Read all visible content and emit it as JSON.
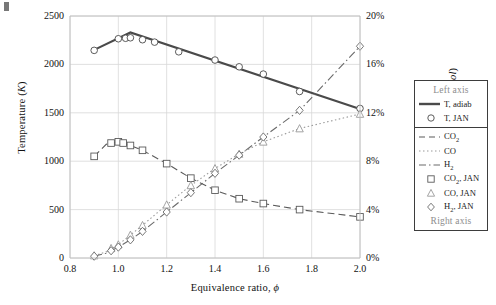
{
  "axes": {
    "left_title": "Temperature (K)",
    "left_title_unit": "K",
    "right_title": "Mole fraction (%mol)",
    "right_title_unit": "%mol",
    "x_title": "Equivalence ratio, ",
    "x_symbol": "ϕ",
    "left_ticks": [
      "0",
      "500",
      "1000",
      "1500",
      "2000",
      "2500"
    ],
    "right_ticks": [
      "0%",
      "4%",
      "8%",
      "12%",
      "16%",
      "20%"
    ],
    "x_ticks": [
      "0.8",
      "1.0",
      "1.2",
      "1.4",
      "1.6",
      "1.8",
      "2.0"
    ]
  },
  "legend": {
    "header": "Left axis",
    "footer": "Right axis",
    "items": [
      {
        "label": "T, adiab",
        "key": "solid-line",
        "color": "#4a4a4a"
      },
      {
        "label": "T, JAN",
        "key": "circle-marker",
        "color": "#4a4a4a"
      },
      {
        "label": "CO2",
        "key": "dashed-line",
        "color": "#5a5a5a"
      },
      {
        "label": "CO",
        "key": "dotted-line",
        "color": "#9a9a9a"
      },
      {
        "label": "H2",
        "key": "dashdot-line",
        "color": "#6a6a6a"
      },
      {
        "label": "CO2, JAN",
        "key": "square-marker",
        "color": "#5a5a5a"
      },
      {
        "label": "CO, JAN",
        "key": "triangle-marker",
        "color": "#9a9a9a"
      },
      {
        "label": "H2, JAN",
        "key": "diamond-marker",
        "color": "#6a6a6a"
      }
    ]
  },
  "chart_data": {
    "type": "line",
    "title": "",
    "xlabel": "Equivalence ratio, ϕ",
    "ylabel": "Temperature (K)",
    "y2label": "Mole fraction (%mol)",
    "xlim": [
      0.8,
      2.0
    ],
    "ylim": [
      0,
      2500
    ],
    "y2lim": [
      0,
      20
    ],
    "grid": true,
    "legend_position": "right-outside",
    "series": [
      {
        "name": "T, adiab",
        "axis": "left",
        "style": "solid",
        "color": "#4a4a4a",
        "x": [
          0.9,
          1.05,
          2.0
        ],
        "values": [
          2150,
          2330,
          1540
        ]
      },
      {
        "name": "T, JAN",
        "axis": "left",
        "style": "markers",
        "marker": "circle",
        "color": "#4a4a4a",
        "x": [
          0.9,
          1.0,
          1.03,
          1.05,
          1.1,
          1.15,
          1.25,
          1.4,
          1.5,
          1.6,
          1.75,
          2.0
        ],
        "values": [
          2145,
          2265,
          2270,
          2275,
          2255,
          2230,
          2130,
          2045,
          1975,
          1900,
          1720,
          1545
        ]
      },
      {
        "name": "CO2",
        "axis": "right",
        "style": "dashed",
        "color": "#5a5a5a",
        "x": [
          0.9,
          0.95,
          1.0,
          1.05,
          1.1,
          1.2,
          1.3,
          1.4,
          1.5,
          1.6,
          1.75,
          2.0
        ],
        "values": [
          8.4,
          9.4,
          9.6,
          9.3,
          8.9,
          7.8,
          6.6,
          5.6,
          4.9,
          4.5,
          4.0,
          3.4
        ]
      },
      {
        "name": "CO",
        "axis": "right",
        "style": "dotted",
        "color": "#9a9a9a",
        "x": [
          0.9,
          0.95,
          1.0,
          1.05,
          1.1,
          1.2,
          1.3,
          1.4,
          1.5,
          1.6,
          1.75,
          2.0
        ],
        "values": [
          0.2,
          0.5,
          1.1,
          1.9,
          2.7,
          4.4,
          6.0,
          7.4,
          8.6,
          9.6,
          10.7,
          11.9
        ]
      },
      {
        "name": "H2",
        "axis": "right",
        "style": "dashdot",
        "color": "#6a6a6a",
        "x": [
          0.9,
          0.95,
          1.0,
          1.05,
          1.1,
          1.2,
          1.3,
          1.4,
          1.5,
          1.6,
          1.75,
          2.0
        ],
        "values": [
          0.15,
          0.4,
          0.9,
          1.5,
          2.2,
          3.8,
          5.4,
          7.0,
          8.5,
          10.0,
          12.2,
          17.5
        ]
      },
      {
        "name": "CO2, JAN",
        "axis": "right",
        "style": "markers",
        "marker": "square",
        "color": "#5a5a5a",
        "x": [
          0.9,
          0.97,
          1.0,
          1.02,
          1.05,
          1.1,
          1.2,
          1.3,
          1.4,
          1.5,
          1.6,
          1.75,
          2.0
        ],
        "values": [
          8.4,
          9.5,
          9.6,
          9.5,
          9.3,
          8.9,
          7.8,
          6.6,
          5.6,
          4.9,
          4.5,
          4.0,
          3.4
        ]
      },
      {
        "name": "CO, JAN",
        "axis": "right",
        "style": "markers",
        "marker": "triangle",
        "color": "#9a9a9a",
        "x": [
          0.9,
          0.97,
          1.0,
          1.05,
          1.1,
          1.2,
          1.3,
          1.4,
          1.5,
          1.6,
          1.75,
          2.0
        ],
        "values": [
          0.2,
          0.8,
          1.1,
          1.9,
          2.7,
          4.4,
          6.0,
          7.4,
          8.6,
          9.6,
          10.7,
          11.9
        ]
      },
      {
        "name": "H2, JAN",
        "axis": "right",
        "style": "markers",
        "marker": "diamond",
        "color": "#6a6a6a",
        "x": [
          0.9,
          0.97,
          1.0,
          1.05,
          1.1,
          1.2,
          1.3,
          1.4,
          1.5,
          1.6,
          1.75,
          2.0
        ],
        "values": [
          0.15,
          0.6,
          0.9,
          1.5,
          2.2,
          3.8,
          5.4,
          7.0,
          8.5,
          10.0,
          12.2,
          17.5
        ]
      }
    ]
  }
}
